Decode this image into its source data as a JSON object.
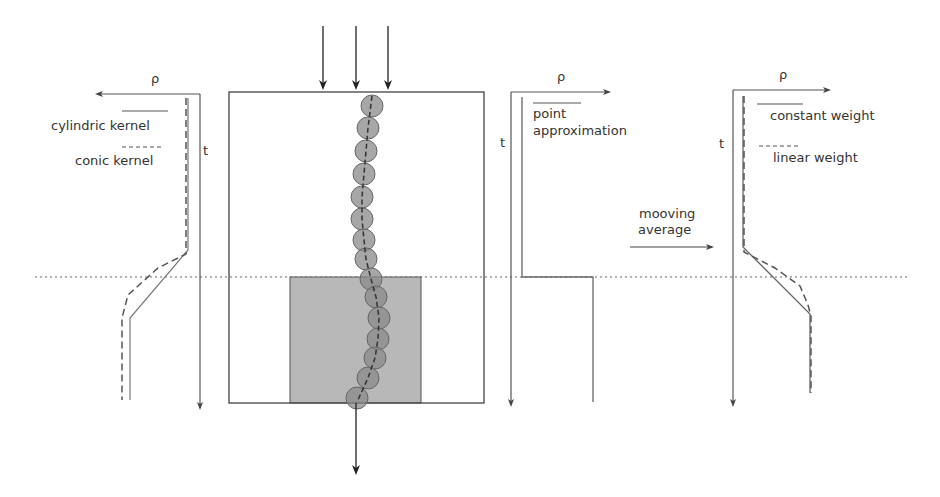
{
  "diagram": {
    "left_panel": {
      "axis_x_label": "ρ",
      "axis_y_label": "t",
      "legend": [
        {
          "label": "cylindric kernel",
          "style": "solid"
        },
        {
          "label": "conic kernel",
          "style": "dashed"
        }
      ]
    },
    "middle_panel": {
      "axis_x_label": "ρ",
      "axis_y_label": "t",
      "legend": [
        {
          "label_line1": "point",
          "label_line2": "approximation",
          "style": "solid"
        }
      ]
    },
    "transition": {
      "label_line1": "mooving",
      "label_line2": "average"
    },
    "right_panel": {
      "axis_x_label": "ρ",
      "axis_y_label": "t",
      "legend": [
        {
          "label": "constant weight",
          "style": "solid"
        },
        {
          "label": "linear weight",
          "style": "dashed"
        }
      ]
    },
    "colors": {
      "line": "#555555",
      "bead_fill": "#8a8a8a",
      "block_fill": "#b8b8b8",
      "text": "#333333"
    }
  }
}
